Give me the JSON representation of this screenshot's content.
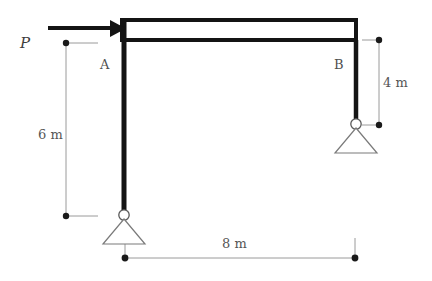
{
  "figure": {
    "type": "structural-frame-diagram",
    "background_color": "#ffffff",
    "member_color": "#1a1a1a",
    "dimension_color": "#8a8a8a",
    "label_color": "#4f4f4f"
  },
  "load": {
    "label": "P",
    "direction": "right",
    "applied_at": "top of left column"
  },
  "nodes": [
    {
      "name": "node-a",
      "label": "A"
    },
    {
      "name": "node-b",
      "label": "B"
    }
  ],
  "supports": [
    {
      "name": "support-left",
      "type": "pin",
      "at": "base of left column"
    },
    {
      "name": "support-right",
      "type": "pin",
      "at": "base of right column"
    }
  ],
  "dimensions": [
    {
      "name": "dimension-left-height",
      "label": "6 m",
      "orientation": "vertical",
      "value": 6,
      "unit": "m"
    },
    {
      "name": "dimension-right-height",
      "label": "4 m",
      "orientation": "vertical",
      "value": 4,
      "unit": "m"
    },
    {
      "name": "dimension-span",
      "label": "8 m",
      "orientation": "horizontal",
      "value": 8,
      "unit": "m"
    }
  ],
  "members": [
    {
      "name": "beam-top",
      "style": "double-line",
      "from": "A",
      "to": "B"
    },
    {
      "name": "column-left",
      "style": "solid",
      "from": "A",
      "to": "support-left"
    },
    {
      "name": "column-right",
      "style": "solid",
      "from": "B",
      "to": "support-right"
    }
  ]
}
